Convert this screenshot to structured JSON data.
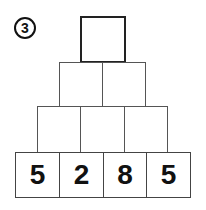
{
  "problem_number": "3",
  "pyramid": {
    "rows": [
      {
        "cells": [
          ""
        ]
      },
      {
        "cells": [
          "",
          ""
        ]
      },
      {
        "cells": [
          "",
          "",
          ""
        ]
      },
      {
        "cells": [
          "5",
          "2",
          "8",
          "5"
        ]
      }
    ]
  }
}
